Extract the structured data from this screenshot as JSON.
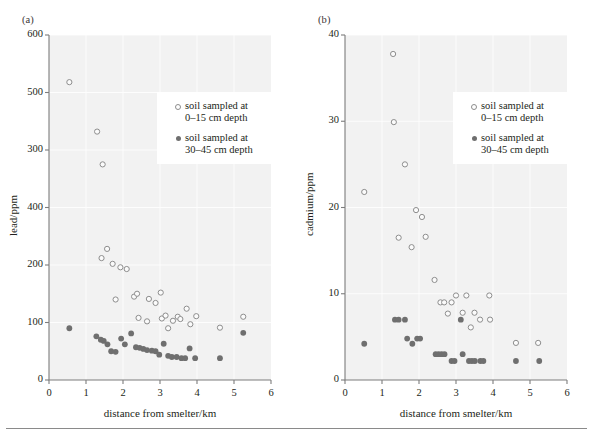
{
  "figure": {
    "bottom_rule": true
  },
  "chart_data": [
    {
      "id": "panel-a",
      "type": "scatter",
      "panel_label": "(a)",
      "title": "",
      "xlabel": "distance from smelter/km",
      "ylabel": "lead/ppm",
      "xlim": [
        0,
        6
      ],
      "ylim": [
        0,
        600
      ],
      "xticks": [
        0,
        1,
        2,
        3,
        4,
        5,
        6
      ],
      "xtick_labels": [
        "0",
        "1",
        "2",
        "3",
        "4",
        "5",
        "6"
      ],
      "yticks": [
        0,
        100,
        200,
        300,
        400,
        500,
        600
      ],
      "ytick_labels": [
        "0",
        "100",
        "200",
        "400",
        "300",
        "500",
        "600"
      ],
      "grid": true,
      "legend_position": "upper right",
      "series": [
        {
          "name": "soil sampled at\n0–15 cm depth",
          "marker": "open-circle",
          "color": "#8d8d8d",
          "points": [
            [
              0.55,
              518
            ],
            [
              1.3,
              432
            ],
            [
              1.45,
              375
            ],
            [
              1.42,
              212
            ],
            [
              1.57,
              228
            ],
            [
              1.72,
              202
            ],
            [
              1.8,
              140
            ],
            [
              1.93,
              196
            ],
            [
              2.1,
              193
            ],
            [
              2.3,
              145
            ],
            [
              2.38,
              150
            ],
            [
              2.42,
              108
            ],
            [
              2.65,
              102
            ],
            [
              2.7,
              141
            ],
            [
              2.88,
              134
            ],
            [
              3.02,
              152
            ],
            [
              3.05,
              107
            ],
            [
              3.15,
              112
            ],
            [
              3.22,
              90
            ],
            [
              3.35,
              103
            ],
            [
              3.48,
              110
            ],
            [
              3.55,
              106
            ],
            [
              3.72,
              124
            ],
            [
              3.82,
              97
            ],
            [
              3.98,
              111
            ],
            [
              4.62,
              91
            ],
            [
              5.25,
              110
            ]
          ]
        },
        {
          "name": "soil sampled at\n30–45 cm depth",
          "marker": "filled-circle",
          "color": "#6f6f6f",
          "points": [
            [
              0.55,
              90
            ],
            [
              1.28,
              76
            ],
            [
              1.4,
              70
            ],
            [
              1.48,
              68
            ],
            [
              1.58,
              62
            ],
            [
              1.68,
              50
            ],
            [
              1.8,
              49
            ],
            [
              1.95,
              72
            ],
            [
              2.05,
              62
            ],
            [
              2.22,
              81
            ],
            [
              2.35,
              57
            ],
            [
              2.45,
              56
            ],
            [
              2.55,
              54
            ],
            [
              2.65,
              52
            ],
            [
              2.78,
              51
            ],
            [
              2.88,
              50
            ],
            [
              2.98,
              44
            ],
            [
              3.1,
              63
            ],
            [
              3.22,
              42
            ],
            [
              3.32,
              40
            ],
            [
              3.45,
              40
            ],
            [
              3.58,
              38
            ],
            [
              3.68,
              38
            ],
            [
              3.8,
              55
            ],
            [
              3.95,
              38
            ],
            [
              4.62,
              38
            ],
            [
              5.25,
              82
            ]
          ]
        }
      ]
    },
    {
      "id": "panel-b",
      "type": "scatter",
      "panel_label": "(b)",
      "title": "",
      "xlabel": "distance from smelter/km",
      "ylabel": "cadmium/ppm",
      "xlim": [
        0,
        6
      ],
      "ylim": [
        0,
        40
      ],
      "xticks": [
        0,
        1,
        2,
        3,
        4,
        5,
        6
      ],
      "xtick_labels": [
        "0",
        "1",
        "2",
        "3",
        "4",
        "5",
        "6"
      ],
      "yticks": [
        0,
        10,
        20,
        30,
        40
      ],
      "ytick_labels": [
        "0",
        "10",
        "20",
        "30",
        "40"
      ],
      "grid": true,
      "legend_position": "upper right",
      "series": [
        {
          "name": "soil sampled at\n0–15 cm depth",
          "marker": "open-circle",
          "color": "#8d8d8d",
          "points": [
            [
              0.52,
              21.8
            ],
            [
              1.3,
              37.8
            ],
            [
              1.32,
              29.9
            ],
            [
              1.45,
              16.5
            ],
            [
              1.62,
              25.0
            ],
            [
              1.8,
              15.4
            ],
            [
              1.92,
              19.7
            ],
            [
              2.08,
              18.9
            ],
            [
              2.18,
              16.6
            ],
            [
              2.42,
              11.6
            ],
            [
              2.58,
              9.0
            ],
            [
              2.68,
              9.0
            ],
            [
              2.78,
              7.7
            ],
            [
              2.88,
              9.0
            ],
            [
              3.0,
              9.8
            ],
            [
              3.18,
              7.8
            ],
            [
              3.28,
              9.8
            ],
            [
              3.4,
              6.1
            ],
            [
              3.5,
              7.8
            ],
            [
              3.65,
              7.0
            ],
            [
              3.9,
              9.8
            ],
            [
              3.92,
              7.0
            ],
            [
              4.62,
              4.3
            ],
            [
              5.22,
              4.3
            ]
          ]
        },
        {
          "name": "soil sampled at\n30–45 cm depth",
          "marker": "filled-circle",
          "color": "#6f6f6f",
          "points": [
            [
              0.52,
              4.2
            ],
            [
              1.35,
              7.0
            ],
            [
              1.45,
              7.0
            ],
            [
              1.62,
              7.0
            ],
            [
              1.68,
              4.8
            ],
            [
              1.82,
              4.2
            ],
            [
              1.95,
              4.8
            ],
            [
              2.03,
              4.8
            ],
            [
              2.45,
              3.0
            ],
            [
              2.53,
              3.0
            ],
            [
              2.61,
              3.0
            ],
            [
              2.69,
              3.0
            ],
            [
              2.88,
              2.2
            ],
            [
              2.96,
              2.2
            ],
            [
              3.13,
              7.0
            ],
            [
              3.18,
              3.0
            ],
            [
              3.35,
              2.2
            ],
            [
              3.43,
              2.2
            ],
            [
              3.51,
              2.2
            ],
            [
              3.66,
              2.2
            ],
            [
              3.74,
              2.2
            ],
            [
              4.62,
              2.2
            ],
            [
              5.25,
              2.2
            ]
          ]
        }
      ]
    }
  ]
}
